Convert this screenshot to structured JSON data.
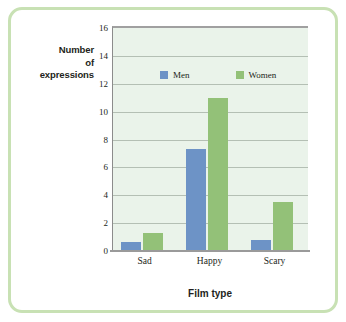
{
  "figure": {
    "frame_color": "#c8e1b4",
    "background": "#ffffff"
  },
  "chart_data": {
    "type": "bar",
    "title": "",
    "categories": [
      "Sad",
      "Happy",
      "Scary"
    ],
    "series": [
      {
        "name": "Men",
        "color": "#6d93c6",
        "values": [
          0.65,
          7.3,
          0.8
        ]
      },
      {
        "name": "Women",
        "color": "#93c178",
        "values": [
          1.3,
          11.0,
          3.5
        ]
      }
    ],
    "xlabel": "Film type",
    "ylabel": "Number of expressions",
    "ylabel_lines": [
      "Number",
      "of",
      "expressions"
    ],
    "ylim": [
      0,
      16
    ],
    "yticks": [
      0,
      2,
      4,
      6,
      8,
      10,
      12,
      14,
      16
    ],
    "ytick_labels": [
      "0",
      "2",
      "4",
      "6",
      "8",
      "10",
      "12",
      "14",
      "16"
    ],
    "grid": true,
    "grid_axis": "y",
    "legend_position": "inside-top-center",
    "plot_background": "#eaf3ea"
  }
}
